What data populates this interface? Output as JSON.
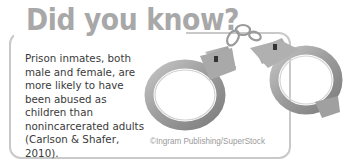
{
  "sidebar_box": {
    "title": "Did you know?",
    "body": "Prison inmates, both male and female, are more likely to have been abused as children than nonincarcerated adults (Carlson & Shafer, 2010).",
    "image": {
      "icon": "handcuffs-image",
      "credit": "©Ingram Publishing/SuperStock"
    }
  },
  "colors": {
    "title": "#a8a8a8",
    "frame": "#c9c9c9",
    "body_text": "#3a3a3a",
    "credit": "#9a9a9a",
    "metal": "#9e9e9e"
  }
}
